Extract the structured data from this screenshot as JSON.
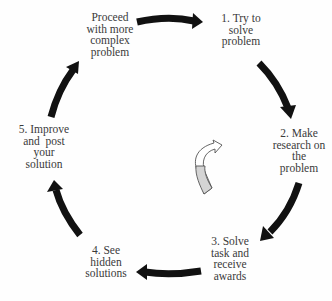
{
  "diagram": {
    "type": "cycle",
    "colors": {
      "arrow": "#111111",
      "text": "#3a3a3a",
      "center_arrow_fill": "#d4d4d4",
      "center_arrow_stroke": "#555555",
      "background": "#fefefe"
    },
    "steps": [
      {
        "id": "step-1",
        "lines": [
          "1. Try to",
          "solve",
          "problem"
        ]
      },
      {
        "id": "step-2",
        "lines": [
          "2. Make",
          "research on",
          "the",
          "problem"
        ]
      },
      {
        "id": "step-3",
        "lines": [
          "3. Solve",
          "task and",
          "receive",
          "awards"
        ]
      },
      {
        "id": "step-4",
        "lines": [
          "4. See",
          "hidden",
          "solutions"
        ]
      },
      {
        "id": "step-5",
        "lines": [
          "5. Improve",
          "and  post",
          "your",
          "solution"
        ]
      },
      {
        "id": "step-6",
        "lines": [
          "Proceed",
          "with more",
          "complex",
          "problem"
        ]
      }
    ],
    "arrows": [
      {
        "from": "step-6",
        "to": "step-1",
        "direction": "right"
      },
      {
        "from": "step-1",
        "to": "step-2",
        "direction": "down-right"
      },
      {
        "from": "step-2",
        "to": "step-3",
        "direction": "down-left"
      },
      {
        "from": "step-3",
        "to": "step-4",
        "direction": "left"
      },
      {
        "from": "step-4",
        "to": "step-5",
        "direction": "up-left"
      },
      {
        "from": "step-5",
        "to": "step-6",
        "direction": "up-right"
      }
    ],
    "center_icon": "clockwise-curved-arrow-icon"
  }
}
